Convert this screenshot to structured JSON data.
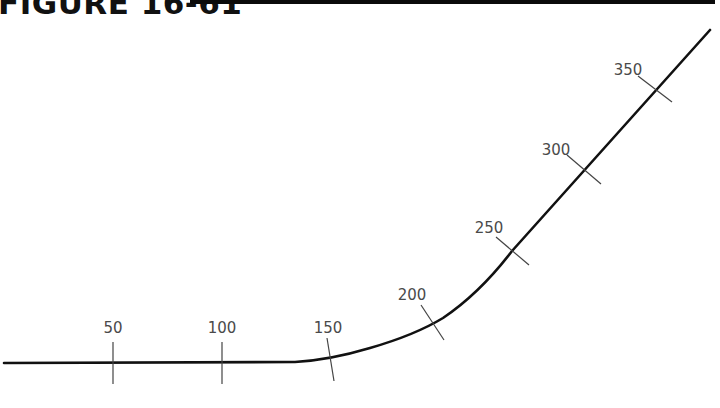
{
  "figure": {
    "title": "FIGURE 16-61"
  },
  "alignment": {
    "description": "Horizontal alignment: tangent, curve, tangent with station ticks",
    "stroke_color": "#111111",
    "path": "M 4 363 L 295 362 Q 330 360 370 348 Q 415 335 443 318 Q 480 293 512 251 L 710 30",
    "stations": [
      {
        "label": "50",
        "tick": {
          "x1": 113,
          "y1": 342,
          "x2": 113,
          "y2": 384
        },
        "label_pos": {
          "x": 113,
          "y": 333
        }
      },
      {
        "label": "100",
        "tick": {
          "x1": 222,
          "y1": 342,
          "x2": 222,
          "y2": 384
        },
        "label_pos": {
          "x": 222,
          "y": 333
        }
      },
      {
        "label": "150",
        "tick": {
          "x1": 327,
          "y1": 338,
          "x2": 334,
          "y2": 381
        },
        "label_pos": {
          "x": 328,
          "y": 333
        }
      },
      {
        "label": "200",
        "tick": {
          "x1": 421,
          "y1": 305,
          "x2": 444,
          "y2": 340
        },
        "label_pos": {
          "x": 412,
          "y": 300
        }
      },
      {
        "label": "250",
        "tick": {
          "x1": 496,
          "y1": 237,
          "x2": 529,
          "y2": 265
        },
        "label_pos": {
          "x": 489,
          "y": 233
        }
      },
      {
        "label": "300",
        "tick": {
          "x1": 567,
          "y1": 155,
          "x2": 601,
          "y2": 184
        },
        "label_pos": {
          "x": 556,
          "y": 155
        }
      },
      {
        "label": "350",
        "tick": {
          "x1": 638,
          "y1": 76,
          "x2": 672,
          "y2": 102
        },
        "label_pos": {
          "x": 628,
          "y": 75
        }
      }
    ]
  }
}
